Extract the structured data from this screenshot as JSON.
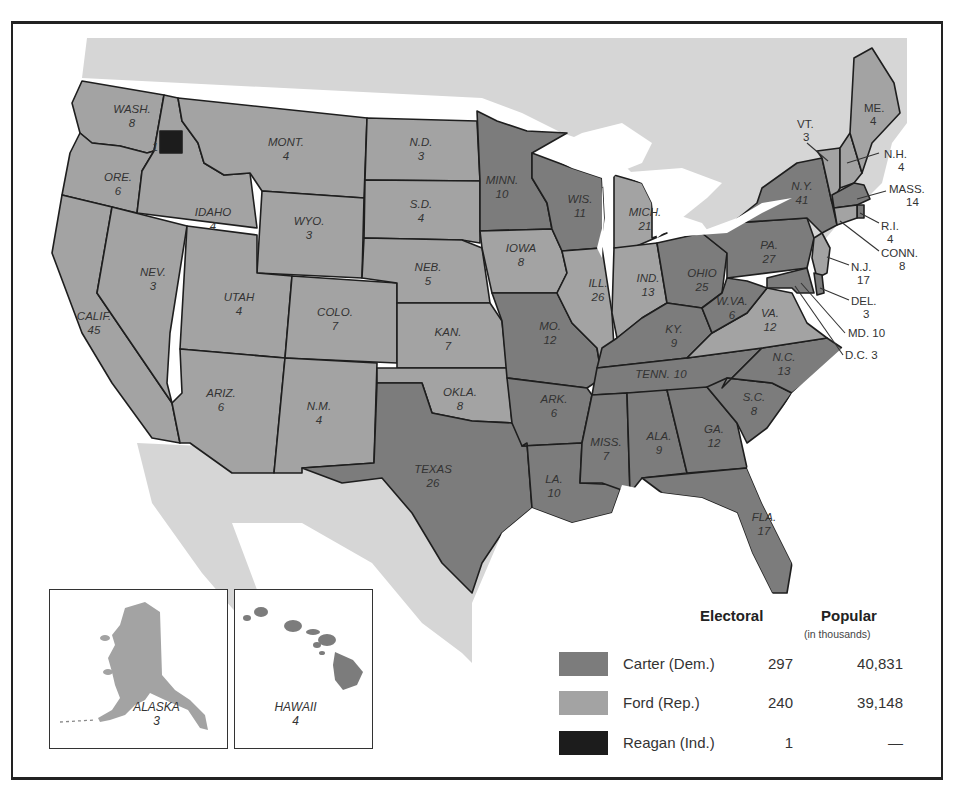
{
  "colors": {
    "carter": "#7c7c7c",
    "ford": "#a3a3a3",
    "reagan": "#1c1c1c",
    "foreign_land": "#d6d6d6",
    "water": "#ffffff",
    "border": "#1e1e1e"
  },
  "legend": {
    "electoral_header": "Electoral",
    "popular_header": "Popular",
    "popular_subheader": "(in thousands)",
    "rows": [
      {
        "name": "Carter (Dem.)",
        "electoral": "297",
        "popular": "40,831",
        "swatch": "carter"
      },
      {
        "name": "Ford (Rep.)",
        "electoral": "240",
        "popular": "39,148",
        "swatch": "ford"
      },
      {
        "name": "Reagan (Ind.)",
        "electoral": "1",
        "popular": "—",
        "swatch": "reagan"
      }
    ]
  },
  "insets": {
    "alaska": {
      "name": "ALASKA",
      "votes": "3"
    },
    "hawaii": {
      "name": "HAWAII",
      "votes": "4"
    }
  },
  "states": {
    "wash": {
      "name": "WASH.",
      "votes": "8",
      "winner": "ford"
    },
    "wash_faithless": {
      "votes": "1",
      "winner": "reagan"
    },
    "ore": {
      "name": "ORE.",
      "votes": "6",
      "winner": "ford"
    },
    "calif": {
      "name": "CALIF.",
      "votes": "45",
      "winner": "ford"
    },
    "idaho": {
      "name": "IDAHO",
      "votes": "4",
      "winner": "ford"
    },
    "nev": {
      "name": "NEV.",
      "votes": "3",
      "winner": "ford"
    },
    "mont": {
      "name": "MONT.",
      "votes": "4",
      "winner": "ford"
    },
    "wyo": {
      "name": "WYO.",
      "votes": "3",
      "winner": "ford"
    },
    "utah": {
      "name": "UTAH",
      "votes": "4",
      "winner": "ford"
    },
    "colo": {
      "name": "COLO.",
      "votes": "7",
      "winner": "ford"
    },
    "ariz": {
      "name": "ARIZ.",
      "votes": "6",
      "winner": "ford"
    },
    "nm": {
      "name": "N.M.",
      "votes": "4",
      "winner": "ford"
    },
    "nd": {
      "name": "N.D.",
      "votes": "3",
      "winner": "ford"
    },
    "sd": {
      "name": "S.D.",
      "votes": "4",
      "winner": "ford"
    },
    "neb": {
      "name": "NEB.",
      "votes": "5",
      "winner": "ford"
    },
    "kan": {
      "name": "KAN.",
      "votes": "7",
      "winner": "ford"
    },
    "okla": {
      "name": "OKLA.",
      "votes": "8",
      "winner": "ford"
    },
    "texas": {
      "name": "TEXAS",
      "votes": "26",
      "winner": "carter"
    },
    "minn": {
      "name": "MINN.",
      "votes": "10",
      "winner": "carter"
    },
    "iowa": {
      "name": "IOWA",
      "votes": "8",
      "winner": "ford"
    },
    "mo": {
      "name": "MO.",
      "votes": "12",
      "winner": "carter"
    },
    "ark": {
      "name": "ARK.",
      "votes": "6",
      "winner": "carter"
    },
    "la": {
      "name": "LA.",
      "votes": "10",
      "winner": "carter"
    },
    "wis": {
      "name": "WIS.",
      "votes": "11",
      "winner": "carter"
    },
    "ill": {
      "name": "ILL.",
      "votes": "26",
      "winner": "ford"
    },
    "mich": {
      "name": "MICH.",
      "votes": "21",
      "winner": "ford"
    },
    "ind": {
      "name": "IND.",
      "votes": "13",
      "winner": "ford"
    },
    "ohio": {
      "name": "OHIO",
      "votes": "25",
      "winner": "carter"
    },
    "ky": {
      "name": "KY.",
      "votes": "9",
      "winner": "carter"
    },
    "tenn": {
      "name": "TENN.",
      "votes": "10",
      "winner": "carter"
    },
    "miss": {
      "name": "MISS.",
      "votes": "7",
      "winner": "carter"
    },
    "ala": {
      "name": "ALA.",
      "votes": "9",
      "winner": "carter"
    },
    "ga": {
      "name": "GA.",
      "votes": "12",
      "winner": "carter"
    },
    "fla": {
      "name": "FLA.",
      "votes": "17",
      "winner": "carter"
    },
    "sc": {
      "name": "S.C.",
      "votes": "8",
      "winner": "carter"
    },
    "nc": {
      "name": "N.C.",
      "votes": "13",
      "winner": "carter"
    },
    "va": {
      "name": "VA.",
      "votes": "12",
      "winner": "ford"
    },
    "wva": {
      "name": "W.VA.",
      "votes": "6",
      "winner": "carter"
    },
    "pa": {
      "name": "PA.",
      "votes": "27",
      "winner": "carter"
    },
    "ny": {
      "name": "N.Y.",
      "votes": "41",
      "winner": "carter"
    },
    "vt": {
      "name": "VT.",
      "votes": "3",
      "winner": "ford"
    },
    "nh": {
      "name": "N.H.",
      "votes": "4",
      "winner": "ford"
    },
    "me": {
      "name": "ME.",
      "votes": "4",
      "winner": "ford"
    },
    "mass": {
      "name": "MASS.",
      "votes": "14",
      "winner": "carter"
    },
    "ri": {
      "name": "R.I.",
      "votes": "4",
      "winner": "carter"
    },
    "conn": {
      "name": "CONN.",
      "votes": "8",
      "winner": "ford"
    },
    "nj": {
      "name": "N.J.",
      "votes": "17",
      "winner": "ford"
    },
    "del": {
      "name": "DEL.",
      "votes": "3",
      "winner": "carter"
    },
    "md": {
      "label": "MD. 10",
      "winner": "carter"
    },
    "dc": {
      "label": "D.C. 3",
      "winner": "carter"
    }
  }
}
